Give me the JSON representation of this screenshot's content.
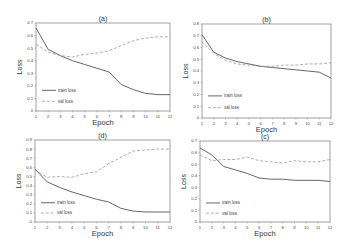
{
  "chart_data": [
    {
      "id": "a",
      "type": "line",
      "title": "(a)",
      "xlabel": "Epoch",
      "ylabel": "Loss",
      "x": [
        1,
        2,
        3,
        4,
        5,
        6,
        7,
        8,
        9,
        10,
        11,
        12
      ],
      "ylim": [
        0,
        0.7
      ],
      "yticks": [
        0,
        0.1,
        0.2,
        0.3,
        0.4,
        0.5,
        0.6,
        0.7
      ],
      "ytick_labels": [
        "0",
        "0.1",
        "0.2",
        "0.3",
        "0.4",
        "0.5",
        "0.6",
        "0.7"
      ],
      "grid": false,
      "legend_position": "lower left",
      "series": [
        {
          "name": "train loss",
          "style": "solid",
          "color": "#555555",
          "values": [
            0.66,
            0.49,
            0.44,
            0.4,
            0.37,
            0.34,
            0.31,
            0.21,
            0.17,
            0.14,
            0.13,
            0.13
          ]
        },
        {
          "name": "val loss",
          "style": "dashed",
          "color": "#999999",
          "values": [
            0.53,
            0.47,
            0.44,
            0.43,
            0.45,
            0.46,
            0.48,
            0.52,
            0.56,
            0.58,
            0.59,
            0.59
          ]
        }
      ]
    },
    {
      "id": "b",
      "type": "line",
      "title": "(b)",
      "xlabel": "Epoch",
      "ylabel": "Loss",
      "x": [
        1,
        2,
        3,
        4,
        5,
        6,
        7,
        8,
        9,
        10,
        11,
        12
      ],
      "ylim": [
        0,
        0.8
      ],
      "yticks": [
        0,
        0.1,
        0.2,
        0.3,
        0.4,
        0.5,
        0.6,
        0.7,
        0.8
      ],
      "ytick_labels": [
        "0",
        "0.1",
        "0.2",
        "0.3",
        "0.4",
        "0.5",
        "0.6",
        "0.7",
        "0.8"
      ],
      "grid": false,
      "legend_position": "lower left",
      "series": [
        {
          "name": "train loss",
          "style": "solid",
          "color": "#555555",
          "values": [
            0.71,
            0.56,
            0.51,
            0.48,
            0.46,
            0.44,
            0.43,
            0.42,
            0.41,
            0.4,
            0.39,
            0.34
          ]
        },
        {
          "name": "val loss",
          "style": "dashed",
          "color": "#999999",
          "values": [
            0.65,
            0.55,
            0.49,
            0.46,
            0.45,
            0.44,
            0.44,
            0.45,
            0.45,
            0.46,
            0.46,
            0.47
          ]
        }
      ]
    },
    {
      "id": "d",
      "type": "line",
      "title": "(d)",
      "xlabel": "Epoch",
      "ylabel": "Loss",
      "x": [
        1,
        2,
        3,
        4,
        5,
        6,
        7,
        8,
        9,
        10,
        11,
        12
      ],
      "ylim": [
        0,
        0.9
      ],
      "yticks": [
        0,
        0.1,
        0.2,
        0.3,
        0.4,
        0.5,
        0.6,
        0.7,
        0.8,
        0.9
      ],
      "ytick_labels": [
        "0",
        "0.1",
        "0.2",
        "0.3",
        "0.4",
        "0.5",
        "0.6",
        "0.7",
        "0.8",
        "0.9"
      ],
      "grid": false,
      "legend_position": "lower left",
      "series": [
        {
          "name": "train loss",
          "style": "solid",
          "color": "#555555",
          "values": [
            0.58,
            0.44,
            0.38,
            0.33,
            0.29,
            0.25,
            0.22,
            0.15,
            0.12,
            0.11,
            0.11,
            0.11
          ]
        },
        {
          "name": "val loss",
          "style": "dashed",
          "color": "#999999",
          "values": [
            0.57,
            0.49,
            0.5,
            0.49,
            0.53,
            0.55,
            0.64,
            0.71,
            0.78,
            0.79,
            0.8,
            0.8
          ]
        }
      ]
    },
    {
      "id": "c",
      "type": "line",
      "title": "(c)",
      "xlabel": "Epoch",
      "ylabel": "Loss",
      "x": [
        1,
        2,
        3,
        4,
        5,
        6,
        7,
        8,
        9,
        10,
        11,
        12
      ],
      "ylim": [
        0,
        0.7
      ],
      "yticks": [
        0,
        0.1,
        0.2,
        0.3,
        0.4,
        0.5,
        0.6,
        0.7
      ],
      "ytick_labels": [
        "0",
        "0.1",
        "0.2",
        "0.3",
        "0.4",
        "0.5",
        "0.6",
        "0.7"
      ],
      "grid": false,
      "legend_position": "lower left",
      "series": [
        {
          "name": "train loss",
          "style": "solid",
          "color": "#555555",
          "values": [
            0.64,
            0.58,
            0.48,
            0.45,
            0.42,
            0.38,
            0.37,
            0.37,
            0.36,
            0.36,
            0.36,
            0.35
          ]
        },
        {
          "name": "val loss",
          "style": "dashed",
          "color": "#999999",
          "values": [
            0.58,
            0.53,
            0.54,
            0.54,
            0.56,
            0.53,
            0.52,
            0.51,
            0.53,
            0.52,
            0.52,
            0.54
          ]
        }
      ]
    }
  ],
  "layout": {
    "panels": [
      {
        "id": "a",
        "left": 36,
        "right": 170,
        "top": 23,
        "bottom": 111
      },
      {
        "id": "b",
        "left": 202,
        "right": 331,
        "top": 24,
        "bottom": 118
      },
      {
        "id": "d",
        "left": 35,
        "right": 170,
        "top": 140,
        "bottom": 222
      },
      {
        "id": "c",
        "left": 200,
        "right": 330,
        "top": 141,
        "bottom": 222
      }
    ]
  }
}
